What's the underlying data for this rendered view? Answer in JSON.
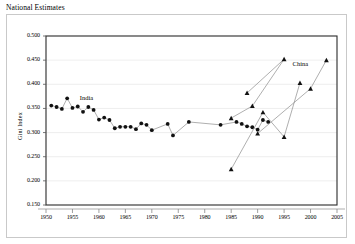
{
  "chart_data": {
    "type": "scatter",
    "title": "National Estimates",
    "xlabel": "",
    "ylabel": "Gini Index",
    "xlim": [
      1950,
      2005
    ],
    "ylim": [
      0.15,
      0.5
    ],
    "grid": true,
    "legend_position": "inline-annotations",
    "xticks": [
      "1950",
      "1955",
      "1960",
      "1965",
      "1970",
      "1975",
      "1980",
      "1985",
      "1990",
      "1995",
      "2000",
      "2005"
    ],
    "yticks": [
      "0.150",
      "0.200",
      "0.250",
      "0.300",
      "0.350",
      "0.400",
      "0.450",
      "0.500"
    ],
    "annotations": [
      {
        "text": "India",
        "x": 1956.4,
        "y": 0.372,
        "series": "India"
      },
      {
        "text": "China",
        "x": 1996.6,
        "y": 0.441,
        "series": "China"
      }
    ],
    "series": [
      {
        "name": "India",
        "marker": "circle",
        "color": "#000000",
        "line_color": "#8c8c8c",
        "points": [
          {
            "x": 1951,
            "y": 0.356
          },
          {
            "x": 1952,
            "y": 0.353
          },
          {
            "x": 1953,
            "y": 0.349
          },
          {
            "x": 1954,
            "y": 0.371
          },
          {
            "x": 1955,
            "y": 0.351
          },
          {
            "x": 1956,
            "y": 0.354
          },
          {
            "x": 1957,
            "y": 0.343
          },
          {
            "x": 1958,
            "y": 0.353
          },
          {
            "x": 1959,
            "y": 0.347
          },
          {
            "x": 1960,
            "y": 0.327
          },
          {
            "x": 1961,
            "y": 0.331
          },
          {
            "x": 1962,
            "y": 0.326
          },
          {
            "x": 1963,
            "y": 0.309
          },
          {
            "x": 1964,
            "y": 0.312
          },
          {
            "x": 1965,
            "y": 0.312
          },
          {
            "x": 1966,
            "y": 0.312
          },
          {
            "x": 1967,
            "y": 0.307
          },
          {
            "x": 1968,
            "y": 0.319
          },
          {
            "x": 1969,
            "y": 0.316
          },
          {
            "x": 1970,
            "y": 0.305
          },
          {
            "x": 1973,
            "y": 0.318
          },
          {
            "x": 1974,
            "y": 0.294
          },
          {
            "x": 1977,
            "y": 0.322
          },
          {
            "x": 1983,
            "y": 0.316
          },
          {
            "x": 1986,
            "y": 0.322
          },
          {
            "x": 1987,
            "y": 0.318
          },
          {
            "x": 1988,
            "y": 0.313
          },
          {
            "x": 1989,
            "y": 0.311
          },
          {
            "x": 1990,
            "y": 0.306
          },
          {
            "x": 1991,
            "y": 0.326
          },
          {
            "x": 1992,
            "y": 0.322
          }
        ]
      },
      {
        "name": "China",
        "marker": "triangle",
        "color": "#000000",
        "line_color": "#8c8c8c",
        "segments": [
          [
            {
              "x": 1985,
              "y": 0.224
            },
            {
              "x": 1991,
              "y": 0.342
            },
            {
              "x": 1995,
              "y": 0.291
            },
            {
              "x": 1998,
              "y": 0.403
            }
          ],
          [
            {
              "x": 1985,
              "y": 0.33
            },
            {
              "x": 1989,
              "y": 0.355
            },
            {
              "x": 1995,
              "y": 0.452
            }
          ],
          [
            {
              "x": 1988,
              "y": 0.382
            },
            {
              "x": 1995,
              "y": 0.452
            }
          ],
          [
            {
              "x": 1990,
              "y": 0.298
            },
            {
              "x": 2000,
              "y": 0.391
            },
            {
              "x": 2003,
              "y": 0.45
            }
          ]
        ],
        "points": [
          {
            "x": 1985,
            "y": 0.224
          },
          {
            "x": 1985,
            "y": 0.33
          },
          {
            "x": 1988,
            "y": 0.382
          },
          {
            "x": 1989,
            "y": 0.355
          },
          {
            "x": 1990,
            "y": 0.298
          },
          {
            "x": 1991,
            "y": 0.342
          },
          {
            "x": 1995,
            "y": 0.291
          },
          {
            "x": 1995,
            "y": 0.452
          },
          {
            "x": 1998,
            "y": 0.403
          },
          {
            "x": 2000,
            "y": 0.391
          },
          {
            "x": 2003,
            "y": 0.45
          }
        ]
      }
    ]
  }
}
